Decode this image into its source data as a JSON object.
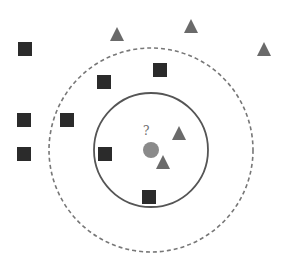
{
  "diagram": {
    "title": "",
    "query_label": "?",
    "colors": {
      "class_a_square": "#2b2b2b",
      "class_b_triangle": "#6a6a6a",
      "query_point": "#8a8a8a",
      "inner_boundary": "#555555",
      "outer_boundary": "#777777",
      "background": "#ffffff"
    },
    "classes": [
      {
        "name": "class-a",
        "shape": "square",
        "count": 9
      },
      {
        "name": "class-b",
        "shape": "triangle",
        "count": 5
      }
    ],
    "neighborhoods": [
      {
        "name": "inner-neighborhood",
        "style": "solid",
        "k": 3
      },
      {
        "name": "outer-neighborhood",
        "style": "dashed",
        "k": 5
      }
    ]
  }
}
